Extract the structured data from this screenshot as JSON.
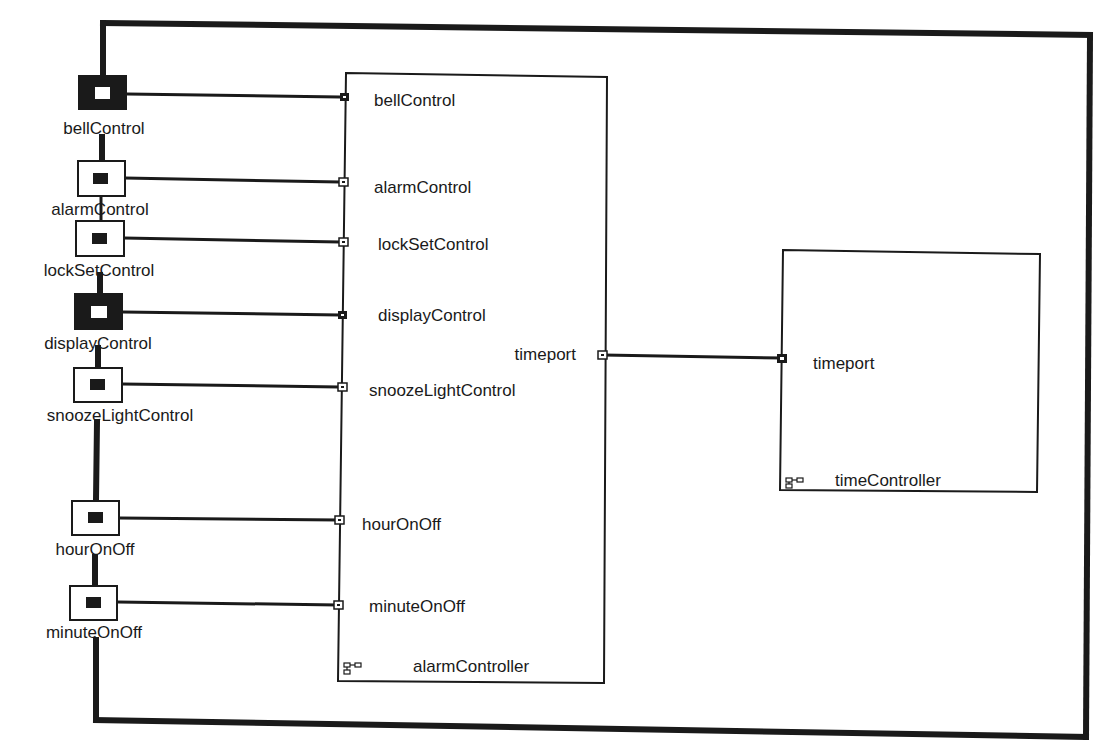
{
  "diagram": {
    "type": "UML-RT capsule structure diagram",
    "colors": {
      "line": "#1a1a1a",
      "background": "#ffffff"
    },
    "outer_ports": [
      {
        "id": "bellControl",
        "label": "bellControl",
        "style": "filled",
        "box": [
          78,
          75,
          49,
          35
        ],
        "label_xy": [
          104,
          134
        ],
        "wire_y": 97
      },
      {
        "id": "alarmControl",
        "label": "alarmControl",
        "style": "hollow",
        "box": [
          77,
          160,
          48,
          36
        ],
        "label_xy": [
          101,
          215
        ],
        "wire_y": 182
      },
      {
        "id": "lockSetControl",
        "label": "lockSetControl",
        "style": "hollow",
        "box": [
          75,
          220,
          49,
          36
        ],
        "label_xy": [
          99,
          276
        ],
        "wire_y": 242
      },
      {
        "id": "displayControl",
        "label": "displayControl",
        "style": "filled",
        "box": [
          74,
          293,
          49,
          37
        ],
        "label_xy": [
          98,
          349
        ],
        "wire_y": 315
      },
      {
        "id": "snoozeLightControl",
        "label": "snoozeLightControl",
        "style": "hollow",
        "box": [
          73,
          367,
          49,
          35
        ],
        "label_xy": [
          97,
          421
        ],
        "wire_y": 387
      },
      {
        "id": "hourOnOff",
        "label": "hourOnOff",
        "style": "hollow",
        "box": [
          72,
          500,
          48,
          35
        ],
        "label_xy": [
          96,
          555
        ],
        "wire_y": 520
      },
      {
        "id": "minuteOnOff",
        "label": "minuteOnOff",
        "style": "hollow",
        "box": [
          70,
          585,
          48,
          35
        ],
        "label_xy": [
          94,
          638
        ],
        "wire_y": 605
      }
    ],
    "capsules": [
      {
        "id": "alarmController",
        "name": "alarmController",
        "box": [
          338,
          73,
          269,
          610
        ],
        "ports": [
          {
            "label": "bellControl",
            "y": 97,
            "style": "filled",
            "side": "left"
          },
          {
            "label": "alarmControl",
            "y": 182,
            "style": "hollow",
            "side": "left"
          },
          {
            "label": "lockSetControl",
            "y": 242,
            "style": "hollow",
            "side": "left"
          },
          {
            "label": "displayControl",
            "y": 315,
            "style": "filled",
            "side": "left"
          },
          {
            "label": "snoozeLightControl",
            "y": 387,
            "style": "hollow",
            "side": "left"
          },
          {
            "label": "hourOnOff",
            "y": 520,
            "style": "hollow",
            "side": "left"
          },
          {
            "label": "minuteOnOff",
            "y": 605,
            "style": "hollow",
            "side": "left"
          },
          {
            "label": "timeport",
            "y": 355,
            "style": "hollow",
            "side": "right"
          }
        ]
      },
      {
        "id": "timeController",
        "name": "timeController",
        "box": [
          780,
          250,
          260,
          242
        ],
        "ports": [
          {
            "label": "timeport",
            "y": 358,
            "style": "filled",
            "side": "left"
          }
        ]
      }
    ],
    "labels": {
      "alarm_ports": {
        "bellControl": "bellControl",
        "alarmControl": "alarmControl",
        "lockSetControl": "lockSetControl",
        "displayControl": "displayControl",
        "snoozeLightControl": "snoozeLightControl",
        "hourOnOff": "hourOnOff",
        "minuteOnOff": "minuteOnOff",
        "timeport": "timeport"
      },
      "time_ports": {
        "timeport": "timeport"
      },
      "capsule_names": {
        "alarmController": "alarmController",
        "timeController": "timeController"
      },
      "outer": {
        "bellControl": "bellControl",
        "alarmControl": "alarmControl",
        "lockSetControl": "lockSetControl",
        "displayControl": "displayControl",
        "snoozeLightControl": "snoozeLightControl",
        "hourOnOff": "hourOnOff",
        "minuteOnOff": "minuteOnOff"
      }
    }
  }
}
